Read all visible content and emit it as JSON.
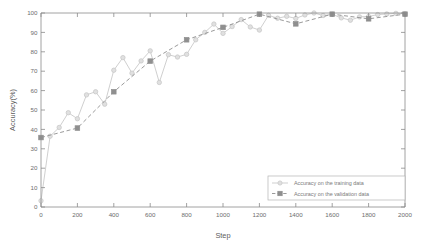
{
  "chart_data": {
    "type": "line",
    "title": "",
    "xlabel": "Step",
    "ylabel": "Accuracy(%)",
    "xlim": [
      0,
      2000
    ],
    "ylim": [
      0,
      100
    ],
    "xticks": [
      0,
      200,
      400,
      600,
      800,
      1000,
      1200,
      1400,
      1600,
      1800,
      2000
    ],
    "yticks": [
      0,
      10,
      20,
      30,
      40,
      50,
      60,
      70,
      80,
      90,
      100
    ],
    "grid": false,
    "legend_position": "lower right",
    "series": [
      {
        "name": "Accuracy on the training data",
        "color": "#c9c9c9",
        "marker": "circle",
        "linestyle": "solid",
        "x": [
          0,
          50,
          100,
          150,
          200,
          250,
          300,
          350,
          400,
          450,
          500,
          550,
          600,
          650,
          700,
          750,
          800,
          850,
          900,
          950,
          1000,
          1050,
          1100,
          1150,
          1200,
          1250,
          1300,
          1350,
          1400,
          1450,
          1500,
          1550,
          1600,
          1650,
          1700,
          1750,
          1800,
          1850,
          1900,
          1950,
          2000
        ],
        "y": [
          3.2,
          36.5,
          41.0,
          48.6,
          45.5,
          57.8,
          59.4,
          53.0,
          70.5,
          77.0,
          69.0,
          75.3,
          80.5,
          64.2,
          78.5,
          77.3,
          78.7,
          86.2,
          90.0,
          94.3,
          89.5,
          93.0,
          96.6,
          92.8,
          91.2,
          98.8,
          97.3,
          98.3,
          97.2,
          99.0,
          100.0,
          98.7,
          99.3,
          97.5,
          96.3,
          98.0,
          98.2,
          99.2,
          99.5,
          99.8,
          99.6
        ]
      },
      {
        "name": "Accuracy on the validation data",
        "color": "#8f8f8f",
        "marker": "square",
        "linestyle": "dashed",
        "x": [
          0,
          200,
          400,
          600,
          800,
          1000,
          1200,
          1400,
          1600,
          1800,
          2000
        ],
        "y": [
          35.8,
          40.7,
          59.4,
          75.2,
          86.2,
          92.6,
          99.4,
          94.4,
          99.4,
          97.0,
          99.4
        ]
      }
    ]
  },
  "legend": {
    "entries": [
      "Accuracy on the training data",
      "Accuracy on the validation data"
    ]
  },
  "axes": {
    "x_label": "Step",
    "y_label": "Accuracy(%)"
  }
}
